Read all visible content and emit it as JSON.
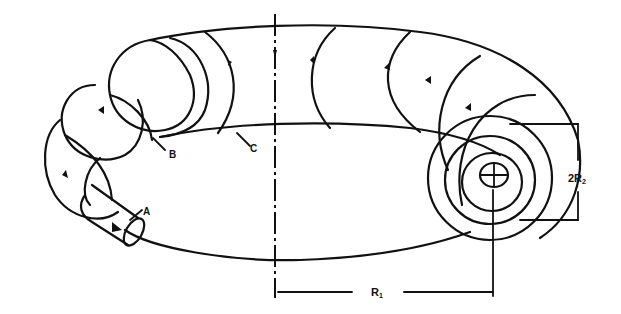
{
  "diagram": {
    "stroke_color": "#111111",
    "background": "#ffffff",
    "labels": {
      "a": "A",
      "b": "B",
      "c": "C",
      "minor_diameter": "2R",
      "minor_diameter_sub": "2",
      "major_radius": "R",
      "major_radius_sub": "1"
    }
  }
}
